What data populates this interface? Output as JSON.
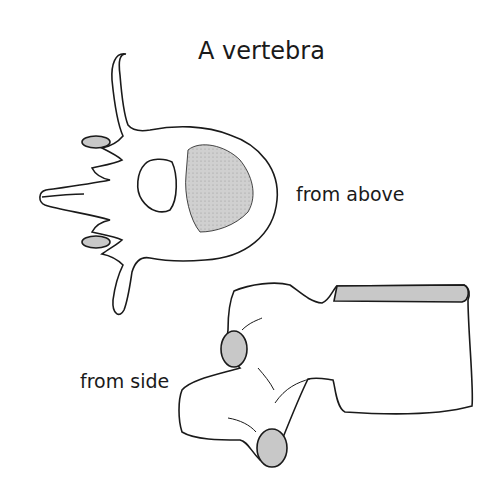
{
  "title": "A vertebra",
  "labels": {
    "from_above": "from above",
    "from_side": "from side"
  },
  "views": [
    {
      "name": "top-view",
      "caption": "from above"
    },
    {
      "name": "side-view",
      "caption": "from side"
    }
  ],
  "colors": {
    "outline": "#1a1a1a",
    "fill_shaded": "#c8c8c8",
    "background": "#ffffff"
  }
}
